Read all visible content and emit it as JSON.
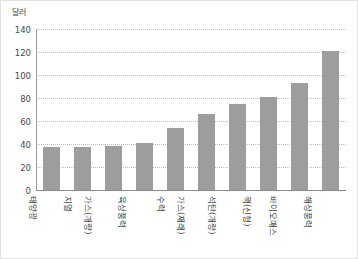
{
  "chart_data": {
    "type": "bar",
    "title": "",
    "subtitle": "",
    "xlabel": "",
    "ylabel": "달러",
    "ylim": [
      0,
      140
    ],
    "yticks": [
      0,
      20,
      40,
      60,
      80,
      100,
      120,
      140
    ],
    "ytick_labels": [
      "0",
      "20",
      "40",
      "60",
      "80",
      "100",
      "120",
      "140"
    ],
    "grid": true,
    "legend": false,
    "legend_position": "none",
    "bar_color": "#9d9d9d",
    "categories": [
      "태양광",
      "지열",
      "가스(개량)",
      "육상풍력",
      "수력",
      "가스(재래)",
      "석탄(개량)",
      "핵(신형)",
      "바이오매스",
      "해상풍력"
    ],
    "values": [
      37,
      37,
      38,
      41,
      54,
      66,
      75,
      81,
      93,
      121
    ],
    "series": [
      {
        "name": "",
        "values": [
          37,
          37,
          38,
          41,
          54,
          66,
          75,
          81,
          93,
          121
        ]
      }
    ]
  },
  "axis": {
    "unit_caption": "달러"
  }
}
